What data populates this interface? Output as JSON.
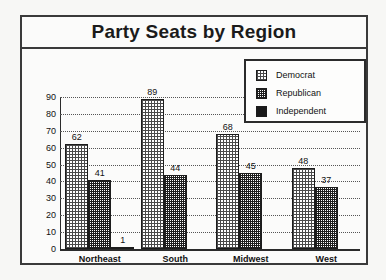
{
  "chart_data": {
    "type": "bar",
    "title": "Party Seats by Region",
    "xlabel": "",
    "ylabel": "",
    "ylim": [
      0,
      90
    ],
    "yticks": [
      0,
      10,
      20,
      30,
      40,
      50,
      60,
      70,
      80,
      90
    ],
    "grid": true,
    "legend_position": "top-right",
    "categories": [
      "Northeast",
      "South",
      "Midwest",
      "West"
    ],
    "series": [
      {
        "name": "Democrat",
        "pattern": "light-crosshatch",
        "values": [
          62,
          89,
          68,
          48
        ],
        "labels": [
          "62",
          "89",
          "68",
          "48"
        ]
      },
      {
        "name": "Republican",
        "pattern": "dense-crosshatch",
        "values": [
          41,
          44,
          45,
          37
        ],
        "labels": [
          "41",
          "44",
          "45",
          "37"
        ]
      },
      {
        "name": "Independent",
        "pattern": "solid-black",
        "values": [
          1,
          0,
          0,
          0
        ],
        "labels": [
          "1",
          "",
          "",
          ""
        ]
      }
    ]
  },
  "colors": {
    "frame": "#3a3a3a",
    "background": "#fbfbfa",
    "text": "#111111",
    "gridline": "#555555",
    "independent_fill": "#1a1a1a"
  }
}
